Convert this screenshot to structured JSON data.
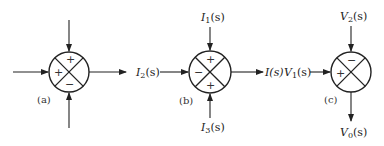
{
  "diagram": {
    "type": "summing-junctions",
    "stroke_color": "#222222",
    "junctions": [
      {
        "id": "a",
        "caption": "(a)",
        "signs": {
          "top": "+",
          "left": "+",
          "bottom": "−"
        },
        "inputs": {
          "top": "",
          "left": "",
          "bottom": ""
        },
        "output": {
          "right": ""
        }
      },
      {
        "id": "b",
        "caption": "(b)",
        "signs": {
          "top": "+",
          "left": "−",
          "bottom": "+"
        },
        "inputs": {
          "top_main": "I",
          "top_sub": "1",
          "top_arg": "(s)",
          "left_main": "I",
          "left_sub": "2",
          "left_arg": "(s)",
          "bottom_main": "I",
          "bottom_sub": "3",
          "bottom_arg": "(s)"
        },
        "output": {
          "right": "I(s)"
        }
      },
      {
        "id": "c",
        "caption": "(c)",
        "signs": {
          "top": "−",
          "left": "+"
        },
        "inputs": {
          "top_main": "V",
          "top_sub": "2",
          "top_arg": "(s)",
          "left_main": "V",
          "left_sub": "1",
          "left_arg": "(s)"
        },
        "output": {
          "bottom_main": "V",
          "bottom_sub": "0",
          "bottom_arg": "(s)"
        }
      }
    ]
  }
}
